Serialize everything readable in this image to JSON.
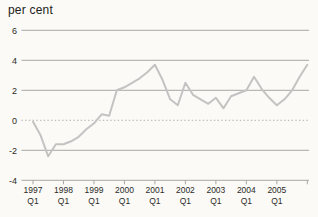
{
  "title": "per cent",
  "chart_data": {
    "type": "line",
    "title": "per cent",
    "x": [
      "1997 Q1",
      "1997 Q2",
      "1997 Q3",
      "1997 Q4",
      "1998 Q1",
      "1998 Q2",
      "1998 Q3",
      "1998 Q4",
      "1999 Q1",
      "1999 Q2",
      "1999 Q3",
      "1999 Q4",
      "2000 Q1",
      "2000 Q2",
      "2000 Q3",
      "2000 Q4",
      "2001 Q1",
      "2001 Q2",
      "2001 Q3",
      "2001 Q4",
      "2002 Q1",
      "2002 Q2",
      "2002 Q3",
      "2002 Q4",
      "2003 Q1",
      "2003 Q2",
      "2003 Q3",
      "2003 Q4",
      "2004 Q1",
      "2004 Q2",
      "2004 Q3",
      "2004 Q4",
      "2005 Q1",
      "2005 Q2",
      "2005 Q3",
      "2005 Q4",
      "2006 Q1"
    ],
    "values": [
      -0.1,
      -1.0,
      -2.4,
      -1.6,
      -1.6,
      -1.4,
      -1.1,
      -0.6,
      -0.2,
      0.4,
      0.3,
      2.0,
      2.2,
      2.5,
      2.8,
      3.2,
      3.7,
      2.7,
      1.4,
      1.0,
      2.5,
      1.7,
      1.4,
      1.1,
      1.5,
      0.8,
      1.6,
      1.8,
      2.0,
      2.9,
      2.1,
      1.5,
      1.0,
      1.4,
      2.0,
      2.9,
      3.7
    ],
    "ylim": [
      -4,
      6
    ],
    "yticks": [
      6,
      4,
      2,
      0,
      -2,
      -4
    ],
    "xticks": [
      {
        "index": 0,
        "label": "1997",
        "sub": "Q1"
      },
      {
        "index": 4,
        "label": "1998",
        "sub": "Q1"
      },
      {
        "index": 8,
        "label": "1999",
        "sub": "Q1"
      },
      {
        "index": 12,
        "label": "2000",
        "sub": "Q1"
      },
      {
        "index": 16,
        "label": "2001",
        "sub": "Q1"
      },
      {
        "index": 20,
        "label": "2002",
        "sub": "Q1"
      },
      {
        "index": 24,
        "label": "2003",
        "sub": "Q1"
      },
      {
        "index": 28,
        "label": "2004",
        "sub": "Q1"
      },
      {
        "index": 32,
        "label": "2005",
        "sub": "Q1"
      },
      {
        "index": 36,
        "label": "",
        "sub": ""
      }
    ],
    "grid": true,
    "zero_line_style": "dotted",
    "legend_position": "none",
    "xlabel": "",
    "ylabel": "per cent",
    "colors": {
      "line": "#c3c3c3",
      "grid": "#9e9e9c",
      "zero_grid": "#a8a8a6",
      "text": "#2b2b29",
      "background": "#fbfaf6"
    }
  }
}
